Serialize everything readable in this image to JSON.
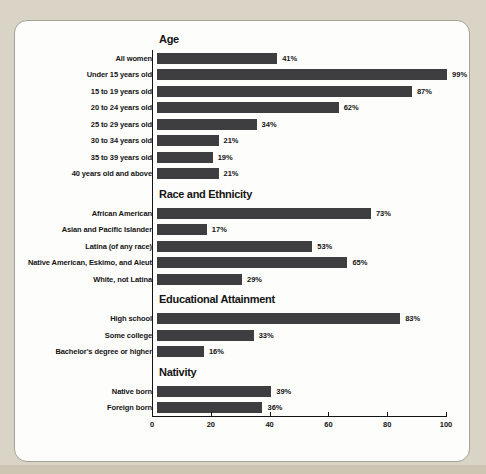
{
  "colors": {
    "page_bg": "#dad4c6",
    "bottom_strip": "#cdc5b1",
    "panel_bg": "#fdfdfb",
    "panel_border": "#a2a299",
    "bar": "#3e3e40",
    "text": "#141414"
  },
  "chart_data": {
    "type": "bar",
    "orientation": "horizontal",
    "value_unit": "%",
    "xlim": [
      0,
      100
    ],
    "x_ticks": [
      0,
      20,
      40,
      60,
      80,
      100
    ],
    "grid": false,
    "legend": false,
    "bar_color": "#3e3e40",
    "sections": [
      {
        "title": "Age",
        "rows": [
          {
            "label": "All women",
            "value": 41,
            "display": "41%"
          },
          {
            "label": "Under 15 years old",
            "value": 99,
            "display": "99%"
          },
          {
            "label": "15 to 19 years old",
            "value": 87,
            "display": "87%"
          },
          {
            "label": "20 to 24 years old",
            "value": 62,
            "display": "62%"
          },
          {
            "label": "25 to 29 years old",
            "value": 34,
            "display": "34%"
          },
          {
            "label": "30 to 34 years old",
            "value": 21,
            "display": "21%"
          },
          {
            "label": "35 to 39 years old",
            "value": 19,
            "display": "19%"
          },
          {
            "label": "40 years old and above",
            "value": 21,
            "display": "21%"
          }
        ]
      },
      {
        "title": "Race and Ethnicity",
        "rows": [
          {
            "label": "African American",
            "value": 73,
            "display": "73%"
          },
          {
            "label": "Asian and Pacific Islander",
            "value": 17,
            "display": "17%"
          },
          {
            "label": "Latina (of any race)",
            "value": 53,
            "display": "53%"
          },
          {
            "label": "Native American, Eskimo, and Aleut",
            "value": 65,
            "display": "65%"
          },
          {
            "label": "White, not Latina",
            "value": 29,
            "display": "29%"
          }
        ]
      },
      {
        "title": "Educational Attainment",
        "rows": [
          {
            "label": "High school",
            "value": 83,
            "display": "83%"
          },
          {
            "label": "Some college",
            "value": 33,
            "display": "33%"
          },
          {
            "label": "Bachelor's degree or higher",
            "value": 16,
            "display": "16%"
          }
        ]
      },
      {
        "title": "Nativity",
        "rows": [
          {
            "label": "Native born",
            "value": 39,
            "display": "39%"
          },
          {
            "label": "Foreign born",
            "value": 36,
            "display": "36%"
          }
        ]
      }
    ]
  }
}
